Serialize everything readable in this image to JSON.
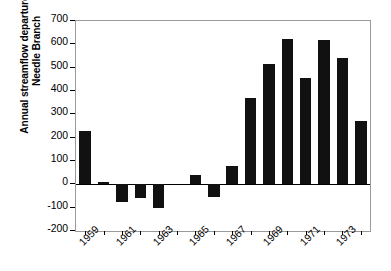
{
  "chart_data": {
    "type": "bar",
    "title": "",
    "xlabel": "",
    "ylabel": "Annual streamflow departure (mm) Needle Branch",
    "ylabel_lines": [
      "Annual streamflow departure (mm)",
      "Needle Branch"
    ],
    "ylim": [
      -200,
      700
    ],
    "ytick_values": [
      700,
      600,
      500,
      400,
      300,
      200,
      100,
      0,
      -100,
      -200
    ],
    "ytick_labels": [
      "700",
      "600",
      "500",
      "400",
      "300",
      "200",
      "100",
      "0",
      "-100",
      "-200"
    ],
    "xtick_labels": [
      "1959",
      "1961",
      "1963",
      "1965",
      "1967",
      "1969",
      "1971",
      "1973"
    ],
    "xtick_years": [
      1959,
      1961,
      1963,
      1965,
      1967,
      1969,
      1971,
      1973
    ],
    "categories": [
      1959,
      1960,
      1961,
      1962,
      1963,
      1964,
      1965,
      1966,
      1967,
      1968,
      1969,
      1970,
      1971,
      1972,
      1973,
      1974
    ],
    "values": [
      230,
      10,
      -75,
      -60,
      -100,
      0,
      40,
      -55,
      80,
      370,
      515,
      625,
      455,
      620,
      540,
      270
    ],
    "grid": false,
    "legend": false,
    "bar_color": "#111111",
    "axis_color": "#9a9a9a",
    "background": "#ffffff"
  },
  "axis": {
    "y_title_line1": "Annual streamflow departure (mm)",
    "y_title_line2": "Needle Branch"
  }
}
